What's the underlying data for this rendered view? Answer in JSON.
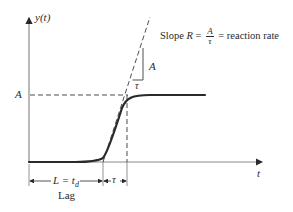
{
  "diagram": {
    "type": "lag-phase growth curve",
    "y_axis_label_var": "y",
    "y_axis_label_arg": "t",
    "x_axis_label": "t",
    "plateau_label": "A",
    "slope_annotation": {
      "prefix": "Slope ",
      "symbol": "R",
      "equals": " = ",
      "fraction_numerator": "A",
      "fraction_denominator": "τ",
      "suffix": " = reaction rate"
    },
    "triangle_rise_label": "A",
    "triangle_run_label": "τ",
    "lag_dimension": {
      "left": "L = t",
      "subscript": "d",
      "caption": "Lag"
    },
    "tau_dimension": "τ",
    "colors": {
      "curve": "#2a2a2a",
      "axes": "#7a7a7a",
      "dashed": "#3a3a3a",
      "text": "#2a2a2a"
    }
  }
}
